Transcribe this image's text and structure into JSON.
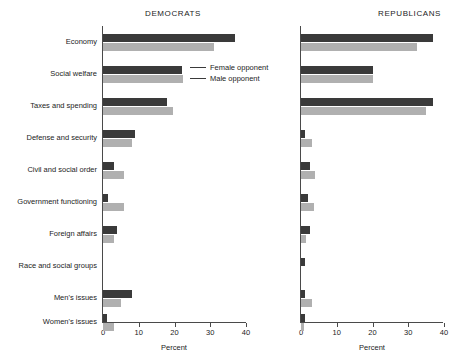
{
  "figure": {
    "axis_title": "Percent",
    "legend": {
      "position": "inside-left-panel-top-right",
      "entries": [
        {
          "label": "Female opponent",
          "key": "female",
          "color": "#3a3a3a"
        },
        {
          "label": "Male opponent",
          "key": "male",
          "color": "#b0b0b0"
        }
      ]
    }
  },
  "chart_data": {
    "type": "bar",
    "orientation": "horizontal",
    "title": "",
    "xlabel": "Percent",
    "ylabel": "",
    "grid": false,
    "legend_position": "inside top-right of left panel",
    "categories": [
      "Economy",
      "Social welfare",
      "Taxes and spending",
      "Defense and security",
      "Civil and social order",
      "Government functioning",
      "Foreign affairs",
      "Race and social groups",
      "Men's issues",
      "Women's issues"
    ],
    "panels": [
      {
        "name": "DEMOCRATS",
        "xlim": [
          0,
          40
        ],
        "xticks": [
          0,
          10,
          20,
          30,
          40
        ],
        "xtick_labels": [
          "0",
          "10",
          "20",
          "30",
          "40"
        ],
        "series": [
          {
            "name": "Female opponent",
            "color": "#3a3a3a",
            "values": [
              37.0,
              22.0,
              18.0,
              9.0,
              3.0,
              1.5,
              4.0,
              0.0,
              8.0,
              1.0
            ]
          },
          {
            "name": "Male opponent",
            "color": "#b0b0b0",
            "values": [
              31.0,
              22.5,
              19.5,
              8.0,
              6.0,
              6.0,
              3.0,
              0.0,
              5.0,
              3.0
            ]
          }
        ]
      },
      {
        "name": "REPUBLICANS",
        "xlim": [
          0,
          40
        ],
        "xticks": [
          0,
          10,
          20,
          30,
          40
        ],
        "xtick_labels": [
          "0",
          "10",
          "20",
          "30",
          "40"
        ],
        "series": [
          {
            "name": "Female opponent",
            "color": "#3a3a3a",
            "values": [
              37.0,
              20.0,
              37.0,
              1.2,
              2.5,
              2.0,
              2.5,
              1.0,
              1.0,
              1.0
            ]
          },
          {
            "name": "Male opponent",
            "color": "#b0b0b0",
            "values": [
              32.5,
              20.0,
              35.0,
              3.0,
              4.0,
              3.5,
              1.5,
              0.0,
              3.0,
              0.8
            ]
          }
        ]
      }
    ]
  }
}
